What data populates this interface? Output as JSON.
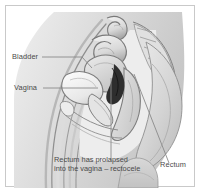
{
  "figure": {
    "frame_color": "#c9c9c9",
    "background_color": "#ffffff",
    "label_color": "#4a4a4a",
    "leader_line_color": "#8a8a8a"
  },
  "labels": {
    "bladder": "Bladder",
    "vagina": "Vagina",
    "rectum": "Rectum"
  },
  "caption": {
    "line1": "Rectum has prolapsed",
    "line2": "into the vagina – rectocele"
  },
  "illustration": {
    "style": "grayscale medical line drawing",
    "view": "sagittal cross-section",
    "structures": [
      "abdominal wall",
      "bowel loop",
      "uterus",
      "bladder",
      "vagina",
      "rectum",
      "prolapsed rectal wall",
      "sacrum",
      "buttock",
      "thigh"
    ],
    "tones": {
      "lightest": "#f2f2f2",
      "light": "#e4e4e4",
      "mid": "#d2d2d2",
      "midtone": "#bdbdbd",
      "dark": "#9a9a9a",
      "outline": "#7d7d7d",
      "shadow": "#2e2e2e"
    }
  }
}
